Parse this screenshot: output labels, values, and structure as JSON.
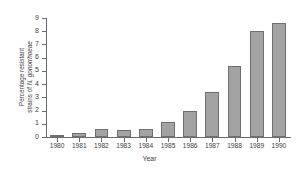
{
  "chart_data": {
    "type": "bar",
    "title": "",
    "xlabel": "Year",
    "ylabel_line1": "Percentage resistant",
    "ylabel_line2_prefix": "strains of ",
    "ylabel_line2_species": "N. gonorrhoeae",
    "ylabel": "Percentage resistant strains of N. gonorrhoeae",
    "categories": [
      "1980",
      "1981",
      "1982",
      "1983",
      "1984",
      "1985",
      "1986",
      "1987",
      "1988",
      "1989",
      "1990"
    ],
    "values": [
      0.15,
      0.3,
      0.6,
      0.55,
      0.6,
      1.15,
      2.0,
      3.4,
      5.35,
      8.05,
      8.6
    ],
    "ylim": [
      0,
      9
    ],
    "ytick_labels": [
      "0",
      "1",
      "2",
      "3",
      "4",
      "5",
      "6",
      "7",
      "8",
      "9"
    ],
    "ytick_values": [
      0,
      1,
      2,
      3,
      4,
      5,
      6,
      7,
      8,
      9
    ],
    "grid": false,
    "legend": false,
    "bar_fill_color": "#a3a3a3",
    "bar_edge_color": "#707070",
    "axis_color": "#6b6b6b",
    "background_color": "#ffffff",
    "text_color": "#3d3d3d"
  }
}
